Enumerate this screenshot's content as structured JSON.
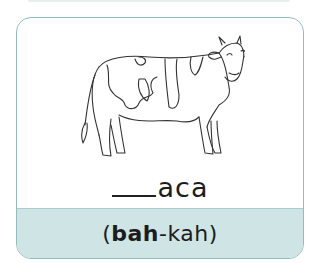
{
  "flashcard": {
    "image_icon": "cow-illustration",
    "word": {
      "blank": "___",
      "suffix": "aca"
    },
    "pronunciation": {
      "open": "(",
      "stressed": "bah",
      "rest": "-kah",
      "close": ")"
    },
    "colors": {
      "border": "#93bcbc",
      "band": "#cfe4e4",
      "text": "#1c1c1c"
    }
  }
}
